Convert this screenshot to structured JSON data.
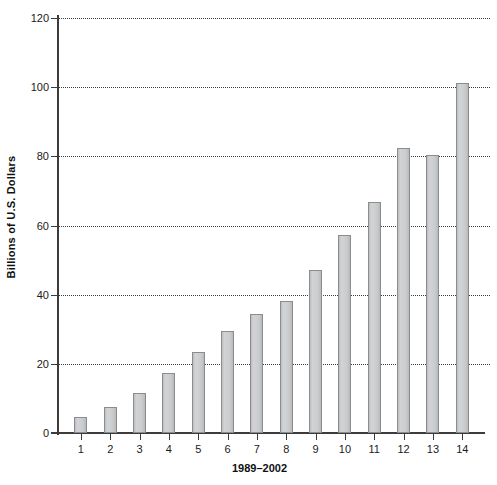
{
  "chart_data": {
    "type": "bar",
    "title": "",
    "subtitle": "",
    "xlabel": "1989–2002",
    "ylabel": "Billions of U.S. Dollars",
    "categories": [
      "1",
      "2",
      "3",
      "4",
      "5",
      "6",
      "7",
      "8",
      "9",
      "10",
      "11",
      "12",
      "13",
      "14"
    ],
    "values": [
      4.6,
      7.4,
      11.5,
      17.3,
      23.4,
      29.4,
      34.4,
      38.2,
      47.0,
      57.3,
      66.8,
      82.4,
      80.5,
      101.2
    ],
    "ylim": [
      0,
      120
    ],
    "yticks": [
      0,
      20,
      40,
      60,
      80,
      100,
      120
    ],
    "ytick_labels": [
      "0",
      "20",
      "40",
      "60",
      "80",
      "100",
      "120"
    ],
    "xlim": [
      0.5,
      14.5
    ],
    "grid": "horizontal-dotted",
    "legend": null,
    "legend_position": "none",
    "bar_fill_color": "#c9cacb",
    "bar_edge_color": "#8a8d8f",
    "axis_color": "#3c3c3c",
    "gridline_color": "#3a3a3a",
    "background_color": "#ffffff"
  }
}
